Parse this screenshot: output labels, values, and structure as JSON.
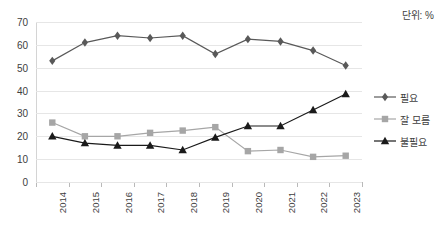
{
  "unit_note": "단위: %",
  "top_cut_text": "─────── ──  ── ── ──   ──  ── ──",
  "legend": {
    "items": [
      {
        "label": "필요",
        "marker": "diamond-marker-icon",
        "color": "#595959"
      },
      {
        "label": "잘 모름",
        "marker": "square-marker-icon",
        "color": "#a6a6a6"
      },
      {
        "label": "불필요",
        "marker": "triangle-marker-icon",
        "color": "#1a1a1a"
      }
    ]
  },
  "chart_data": {
    "type": "line",
    "title": "",
    "subtitle": "",
    "xlabel": "",
    "ylabel": "",
    "unit": "%",
    "categories": [
      "2014",
      "2015",
      "2016",
      "2017",
      "2018",
      "2019",
      "2020",
      "2021",
      "2022",
      "2023"
    ],
    "yticks": [
      0,
      10,
      20,
      30,
      40,
      50,
      60,
      70
    ],
    "ylim": [
      0,
      70
    ],
    "grid": "horizontal",
    "legend_position": "right",
    "series": [
      {
        "name": "필요",
        "marker": "diamond",
        "color": "#595959",
        "values": [
          53,
          61,
          64,
          63,
          64,
          56,
          62.5,
          61.5,
          57.5,
          51
        ]
      },
      {
        "name": "잘 모름",
        "marker": "square",
        "color": "#a6a6a6",
        "values": [
          26,
          20,
          20,
          21.5,
          22.5,
          24,
          13.5,
          14,
          11,
          11.5
        ]
      },
      {
        "name": "불필요",
        "marker": "triangle",
        "color": "#1a1a1a",
        "values": [
          20,
          17,
          16,
          16,
          14,
          19.5,
          24.5,
          24.5,
          31.5,
          38.5
        ]
      }
    ]
  }
}
